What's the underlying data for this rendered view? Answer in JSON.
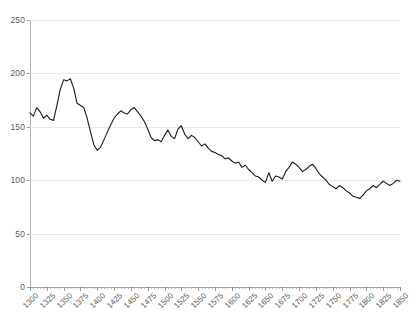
{
  "chart_data": {
    "type": "line",
    "title": "",
    "subtitle": "",
    "xlabel": "",
    "ylabel": "",
    "xlim": [
      1300,
      1850
    ],
    "ylim": [
      0,
      250
    ],
    "grid": true,
    "legend": "none",
    "y_ticks": [
      0,
      50,
      100,
      150,
      200,
      250
    ],
    "x_ticks": [
      1300,
      1325,
      1350,
      1375,
      1400,
      1425,
      1450,
      1475,
      1500,
      1525,
      1550,
      1575,
      1600,
      1625,
      1650,
      1675,
      1700,
      1725,
      1750,
      1775,
      1800,
      1825,
      1850
    ],
    "x_minor_tick_step": 5,
    "series": [
      {
        "name": "series-1",
        "color": "#1a1a1a",
        "x": [
          1300,
          1305,
          1310,
          1315,
          1320,
          1325,
          1330,
          1335,
          1340,
          1345,
          1350,
          1355,
          1360,
          1365,
          1370,
          1375,
          1380,
          1385,
          1390,
          1395,
          1400,
          1405,
          1410,
          1415,
          1420,
          1425,
          1430,
          1435,
          1440,
          1445,
          1450,
          1455,
          1460,
          1465,
          1470,
          1475,
          1480,
          1485,
          1490,
          1495,
          1500,
          1505,
          1510,
          1515,
          1520,
          1525,
          1530,
          1535,
          1540,
          1545,
          1550,
          1555,
          1560,
          1565,
          1570,
          1575,
          1580,
          1585,
          1590,
          1595,
          1600,
          1605,
          1610,
          1615,
          1620,
          1625,
          1630,
          1635,
          1640,
          1645,
          1650,
          1655,
          1660,
          1665,
          1670,
          1675,
          1680,
          1685,
          1690,
          1695,
          1700,
          1705,
          1710,
          1715,
          1720,
          1725,
          1730,
          1735,
          1740,
          1745,
          1750,
          1755,
          1760,
          1765,
          1770,
          1775,
          1780,
          1785,
          1790,
          1795,
          1800,
          1805,
          1810,
          1815,
          1820,
          1825,
          1830,
          1835,
          1840,
          1845,
          1850
        ],
        "y": [
          163,
          160,
          168,
          164,
          158,
          161,
          157,
          156,
          170,
          185,
          194,
          193,
          195,
          186,
          172,
          170,
          168,
          158,
          145,
          133,
          128,
          131,
          138,
          145,
          152,
          158,
          162,
          165,
          163,
          162,
          166,
          168,
          164,
          160,
          155,
          148,
          140,
          137,
          138,
          136,
          142,
          147,
          141,
          139,
          148,
          151,
          143,
          139,
          142,
          140,
          136,
          132,
          134,
          130,
          127,
          126,
          124,
          123,
          120,
          121,
          118,
          116,
          117,
          112,
          114,
          110,
          107,
          104,
          103,
          100,
          98,
          107,
          99,
          104,
          103,
          101,
          108,
          112,
          117,
          115,
          112,
          108,
          110,
          113,
          115,
          111,
          106,
          103,
          100,
          96,
          94,
          92,
          95,
          93,
          90,
          88,
          85,
          84,
          83,
          86,
          90,
          92,
          95,
          93,
          96,
          99,
          97,
          95,
          97,
          100,
          99
        ]
      }
    ]
  },
  "axes": {
    "y_tick_labels": [
      "250",
      "200",
      "150",
      "100",
      "50",
      "0"
    ],
    "x_tick_labels": [
      "1300",
      "1325",
      "1350",
      "1375",
      "1400",
      "1425",
      "1450",
      "1475",
      "1500",
      "1525",
      "1550",
      "1575",
      "1600",
      "1625",
      "1650",
      "1675",
      "1700",
      "1725",
      "1750",
      "1775",
      "1800",
      "1825",
      "1850"
    ]
  },
  "colors": {
    "series": "#1a1a1a",
    "grid": "#e8e8e8",
    "axis": "#9a9a9a",
    "tick_text": "#5a5a5a",
    "background": "#ffffff"
  }
}
